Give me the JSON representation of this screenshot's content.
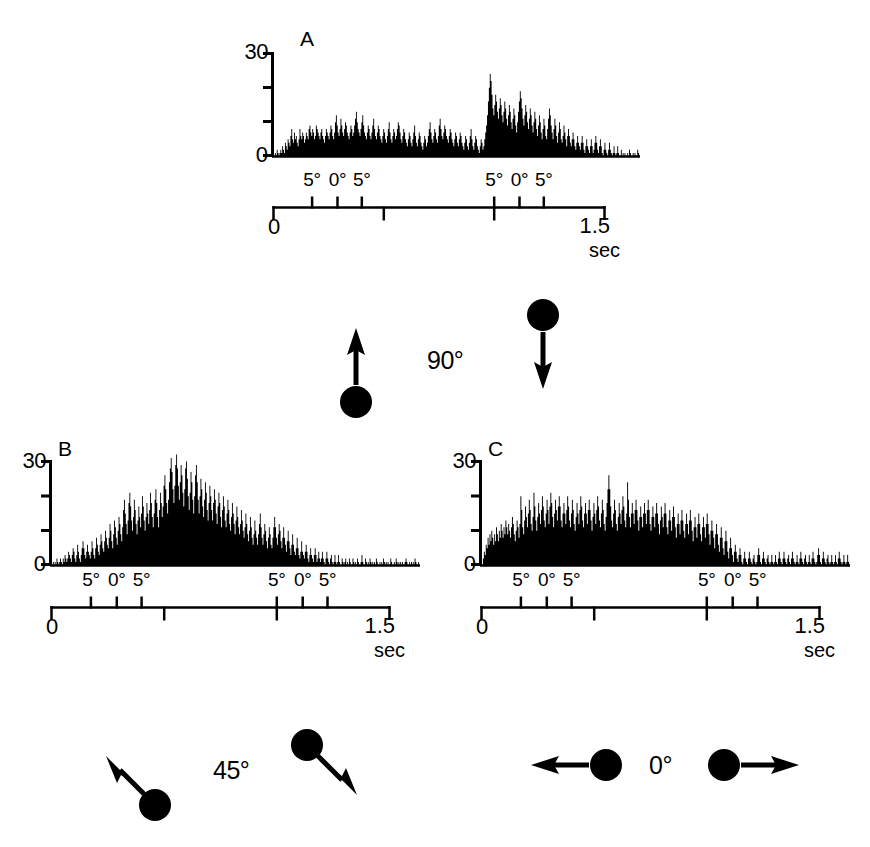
{
  "figure": {
    "type": "neurophysiology-psth-figure",
    "background": "#ffffff",
    "ink_color": "#000000"
  },
  "panels": [
    {
      "id": "A",
      "letter": "A",
      "y_axis": {
        "max_label": "30",
        "min_label": "0",
        "ticks": [
          0,
          10,
          20,
          30
        ],
        "max": 30,
        "min": 0
      },
      "x_axis": {
        "start_label": "0",
        "end_label": "1.5",
        "unit_label": "sec",
        "range": [
          0,
          1.5
        ],
        "major_division_times": [
          0.0,
          0.5,
          1.0,
          1.5
        ],
        "eye_position_ticks": [
          {
            "label": "5°",
            "t": 0.175
          },
          {
            "label": "0°",
            "t": 0.29
          },
          {
            "label": "5°",
            "t": 0.4
          },
          {
            "label": "5°",
            "t": 1.0
          },
          {
            "label": "0°",
            "t": 1.115
          },
          {
            "label": "5°",
            "t": 1.225
          }
        ]
      }
    },
    {
      "id": "B",
      "letter": "B",
      "y_axis": {
        "max_label": "30",
        "min_label": "0",
        "ticks": [
          0,
          10,
          20,
          30
        ],
        "max": 30,
        "min": 0
      },
      "x_axis": {
        "start_label": "0",
        "end_label": "1.5",
        "unit_label": "sec",
        "range": [
          0,
          1.5
        ],
        "major_division_times": [
          0.0,
          0.5,
          1.0,
          1.5
        ],
        "eye_position_ticks": [
          {
            "label": "5°",
            "t": 0.175
          },
          {
            "label": "0°",
            "t": 0.29
          },
          {
            "label": "5°",
            "t": 0.4
          },
          {
            "label": "5°",
            "t": 1.0
          },
          {
            "label": "0°",
            "t": 1.115
          },
          {
            "label": "5°",
            "t": 1.225
          }
        ]
      }
    },
    {
      "id": "C",
      "letter": "C",
      "y_axis": {
        "max_label": "30",
        "min_label": "0",
        "ticks": [
          0,
          10,
          20,
          30
        ],
        "max": 30,
        "min": 0
      },
      "x_axis": {
        "start_label": "0",
        "end_label": "1.5",
        "unit_label": "sec",
        "range": [
          0,
          1.5
        ],
        "major_division_times": [
          0.0,
          0.5,
          1.0,
          1.5
        ],
        "eye_position_ticks": [
          {
            "label": "5°",
            "t": 0.175
          },
          {
            "label": "0°",
            "t": 0.29
          },
          {
            "label": "5°",
            "t": 0.4
          },
          {
            "label": "5°",
            "t": 1.0
          },
          {
            "label": "0°",
            "t": 1.115
          },
          {
            "label": "5°",
            "t": 1.225
          }
        ]
      }
    }
  ],
  "stimulus_groups": [
    {
      "id": "stim-90",
      "angle_label": "90°",
      "icons": [
        {
          "name": "dot-arrow-up",
          "direction": "up"
        },
        {
          "name": "dot-arrow-down",
          "direction": "down"
        }
      ]
    },
    {
      "id": "stim-45",
      "angle_label": "45°",
      "icons": [
        {
          "name": "dot-arrow-up-left",
          "direction": "up-left"
        },
        {
          "name": "dot-arrow-down-right",
          "direction": "down-right"
        }
      ]
    },
    {
      "id": "stim-0",
      "angle_label": "0°",
      "icons": [
        {
          "name": "dot-arrow-left",
          "direction": "left"
        },
        {
          "name": "dot-arrow-right",
          "direction": "right"
        }
      ]
    }
  ],
  "chart_data": [
    {
      "type": "bar",
      "id": "A",
      "title": "A",
      "xlabel": "sec",
      "ylabel": "",
      "xlim": [
        0,
        1.5
      ],
      "ylim": [
        0,
        30
      ],
      "grid": false,
      "legend": false,
      "bin_width": 0.0075,
      "note": "Peristimulus time histogram, 90° direction pair; two activity epochs separated by a quiet gap",
      "values": [
        0,
        1,
        0,
        2,
        1,
        0,
        1,
        2,
        1,
        3,
        2,
        1,
        4,
        3,
        2,
        5,
        4,
        3,
        6,
        8,
        5,
        4,
        7,
        5,
        6,
        4,
        3,
        5,
        8,
        6,
        5,
        7,
        6,
        4,
        5,
        7,
        6,
        5,
        8,
        9,
        7,
        6,
        8,
        7,
        5,
        6,
        9,
        8,
        7,
        6,
        5,
        7,
        8,
        6,
        5,
        4,
        6,
        8,
        7,
        6,
        5,
        7,
        9,
        8,
        6,
        5,
        7,
        10,
        12,
        9,
        7,
        6,
        8,
        11,
        9,
        7,
        6,
        8,
        10,
        9,
        7,
        6,
        5,
        7,
        9,
        8,
        6,
        7,
        9,
        11,
        13,
        10,
        8,
        7,
        6,
        8,
        10,
        12,
        9,
        7,
        6,
        5,
        7,
        9,
        8,
        6,
        5,
        7,
        9,
        11,
        8,
        6,
        5,
        7,
        9,
        8,
        6,
        5,
        4,
        6,
        8,
        7,
        5,
        4,
        6,
        8,
        10,
        7,
        5,
        4,
        6,
        8,
        7,
        5,
        6,
        8,
        10,
        9,
        7,
        5,
        4,
        6,
        8,
        7,
        5,
        4,
        3,
        5,
        7,
        6,
        4,
        3,
        5,
        7,
        9,
        6,
        4,
        3,
        5,
        7,
        6,
        4,
        3,
        2,
        4,
        6,
        5,
        3,
        4,
        6,
        8,
        10,
        7,
        5,
        4,
        6,
        8,
        7,
        5,
        4,
        6,
        9,
        11,
        8,
        6,
        5,
        7,
        9,
        8,
        6,
        5,
        4,
        6,
        8,
        7,
        5,
        4,
        3,
        5,
        7,
        6,
        4,
        3,
        5,
        7,
        6,
        4,
        3,
        2,
        4,
        6,
        5,
        3,
        2,
        4,
        6,
        8,
        5,
        3,
        2,
        4,
        6,
        5,
        3,
        2,
        1,
        3,
        5,
        4,
        2,
        3,
        5,
        7,
        9,
        12,
        16,
        20,
        24,
        22,
        18,
        14,
        12,
        15,
        18,
        16,
        13,
        11,
        14,
        17,
        15,
        12,
        10,
        13,
        16,
        14,
        11,
        9,
        12,
        15,
        13,
        10,
        8,
        11,
        14,
        12,
        9,
        7,
        10,
        13,
        16,
        19,
        17,
        14,
        11,
        9,
        12,
        15,
        13,
        10,
        8,
        11,
        14,
        12,
        9,
        7,
        10,
        13,
        11,
        8,
        6,
        9,
        12,
        10,
        7,
        5,
        8,
        11,
        9,
        6,
        5,
        8,
        11,
        14,
        12,
        9,
        7,
        5,
        8,
        11,
        9,
        6,
        4,
        7,
        10,
        8,
        5,
        4,
        6,
        9,
        7,
        5,
        3,
        6,
        8,
        6,
        4,
        3,
        5,
        7,
        5,
        3,
        2,
        4,
        6,
        4,
        3,
        2,
        4,
        6,
        4,
        2,
        1,
        3,
        5,
        3,
        2,
        1,
        3,
        5,
        3,
        1,
        2,
        4,
        6,
        4,
        2,
        1,
        3,
        5,
        3,
        1,
        0,
        2,
        4,
        2,
        1,
        0,
        2,
        4,
        2,
        1,
        0,
        1,
        3,
        1,
        0,
        1,
        3,
        1,
        0,
        0,
        2,
        0,
        1,
        0,
        1,
        0,
        0,
        1,
        0,
        2,
        1,
        0,
        0,
        1,
        0,
        1,
        0,
        0,
        2,
        1,
        0
      ]
    },
    {
      "type": "bar",
      "id": "B",
      "title": "B",
      "xlabel": "sec",
      "ylabel": "",
      "xlim": [
        0,
        1.5
      ],
      "ylim": [
        0,
        32
      ],
      "grid": false,
      "legend": false,
      "bin_width": 0.0075,
      "note": "Peristimulus time histogram, 45° direction pair; single strong early peak reaching ~32 then decaying to baseline",
      "values": [
        0,
        1,
        0,
        1,
        0,
        2,
        1,
        0,
        1,
        2,
        1,
        0,
        2,
        1,
        3,
        2,
        1,
        2,
        4,
        3,
        2,
        1,
        3,
        5,
        4,
        2,
        1,
        3,
        6,
        4,
        2,
        1,
        3,
        5,
        7,
        5,
        3,
        2,
        4,
        6,
        4,
        3,
        2,
        4,
        7,
        5,
        3,
        2,
        5,
        8,
        6,
        4,
        3,
        6,
        9,
        7,
        5,
        4,
        7,
        10,
        8,
        6,
        5,
        8,
        12,
        10,
        7,
        5,
        9,
        13,
        11,
        8,
        6,
        10,
        14,
        12,
        9,
        7,
        11,
        16,
        19,
        15,
        12,
        9,
        13,
        18,
        21,
        17,
        13,
        10,
        14,
        19,
        16,
        12,
        9,
        13,
        17,
        14,
        11,
        15,
        20,
        17,
        13,
        10,
        14,
        18,
        15,
        12,
        16,
        21,
        18,
        14,
        11,
        15,
        19,
        22,
        18,
        14,
        11,
        16,
        21,
        18,
        14,
        17,
        23,
        26,
        22,
        18,
        15,
        19,
        24,
        28,
        31,
        27,
        22,
        18,
        23,
        29,
        32,
        28,
        23,
        19,
        24,
        29,
        26,
        21,
        17,
        22,
        28,
        30,
        25,
        20,
        16,
        21,
        27,
        24,
        19,
        15,
        20,
        26,
        29,
        24,
        19,
        15,
        20,
        25,
        22,
        17,
        14,
        19,
        24,
        21,
        16,
        13,
        18,
        23,
        20,
        16,
        13,
        18,
        22,
        19,
        15,
        12,
        17,
        21,
        18,
        14,
        11,
        16,
        20,
        17,
        13,
        11,
        15,
        19,
        16,
        12,
        10,
        14,
        18,
        15,
        12,
        9,
        13,
        17,
        14,
        11,
        9,
        12,
        16,
        13,
        10,
        8,
        11,
        15,
        12,
        9,
        7,
        10,
        14,
        11,
        8,
        6,
        9,
        13,
        10,
        8,
        6,
        9,
        12,
        15,
        11,
        8,
        6,
        9,
        12,
        10,
        7,
        5,
        8,
        11,
        9,
        6,
        5,
        8,
        11,
        14,
        11,
        8,
        6,
        9,
        12,
        10,
        7,
        5,
        8,
        11,
        8,
        6,
        4,
        7,
        10,
        7,
        5,
        3,
        6,
        9,
        6,
        4,
        3,
        5,
        8,
        5,
        3,
        2,
        4,
        7,
        4,
        3,
        2,
        4,
        6,
        4,
        2,
        1,
        3,
        5,
        3,
        2,
        1,
        3,
        5,
        3,
        1,
        2,
        4,
        2,
        1,
        2,
        4,
        2,
        1,
        0,
        2,
        4,
        2,
        1,
        0,
        2,
        3,
        1,
        0,
        1,
        3,
        1,
        0,
        1,
        3,
        1,
        0,
        0,
        2,
        1,
        0,
        1,
        2,
        0,
        1,
        0,
        2,
        1,
        0,
        0,
        2,
        1,
        0,
        1,
        0,
        2,
        1,
        0,
        0,
        1,
        3,
        1,
        0,
        0,
        2,
        1,
        0,
        1,
        0,
        2,
        1,
        0,
        1,
        0,
        1,
        0,
        2,
        1,
        0,
        0,
        1,
        0,
        1,
        0,
        2,
        1,
        0,
        1,
        0,
        1,
        0,
        0,
        2,
        1,
        0,
        0,
        1,
        0,
        2,
        1,
        0,
        1,
        0,
        1,
        0,
        1,
        0,
        0,
        1,
        2,
        1,
        0,
        0,
        1,
        0,
        1,
        0,
        1,
        0,
        2,
        1,
        0,
        0,
        1,
        0
      ]
    },
    {
      "type": "bar",
      "id": "C",
      "title": "C",
      "xlabel": "sec",
      "ylabel": "",
      "xlim": [
        0,
        1.5
      ],
      "ylim": [
        0,
        28
      ],
      "grid": false,
      "legend": false,
      "bin_width": 0.0075,
      "note": "Peristimulus time histogram, 0° direction pair; broad sustained plateau for first two-thirds then low baseline",
      "values": [
        0,
        2,
        4,
        3,
        6,
        5,
        8,
        6,
        9,
        7,
        10,
        8,
        6,
        9,
        7,
        11,
        9,
        7,
        10,
        8,
        12,
        10,
        8,
        11,
        9,
        13,
        11,
        9,
        12,
        10,
        8,
        11,
        14,
        12,
        9,
        7,
        10,
        13,
        11,
        8,
        12,
        20,
        16,
        11,
        9,
        13,
        17,
        14,
        11,
        15,
        19,
        16,
        12,
        10,
        14,
        21,
        17,
        13,
        10,
        14,
        18,
        15,
        12,
        16,
        20,
        17,
        13,
        11,
        15,
        19,
        16,
        12,
        17,
        21,
        18,
        14,
        11,
        15,
        19,
        16,
        13,
        17,
        20,
        17,
        13,
        11,
        15,
        18,
        15,
        12,
        16,
        20,
        17,
        13,
        11,
        15,
        19,
        16,
        12,
        10,
        14,
        18,
        15,
        12,
        16,
        20,
        17,
        13,
        11,
        15,
        18,
        15,
        12,
        16,
        19,
        16,
        13,
        10,
        14,
        18,
        15,
        12,
        16,
        20,
        17,
        13,
        11,
        15,
        19,
        16,
        12,
        10,
        14,
        18,
        22,
        26,
        22,
        17,
        13,
        11,
        15,
        19,
        16,
        12,
        10,
        14,
        18,
        15,
        12,
        16,
        20,
        17,
        13,
        11,
        15,
        24,
        19,
        14,
        11,
        15,
        18,
        15,
        12,
        16,
        19,
        16,
        13,
        10,
        14,
        17,
        14,
        11,
        15,
        18,
        15,
        12,
        16,
        19,
        16,
        12,
        10,
        14,
        17,
        14,
        11,
        15,
        18,
        15,
        12,
        9,
        13,
        17,
        14,
        11,
        15,
        18,
        15,
        11,
        9,
        13,
        16,
        13,
        10,
        14,
        17,
        14,
        11,
        8,
        12,
        15,
        12,
        9,
        13,
        16,
        13,
        10,
        8,
        12,
        15,
        12,
        9,
        13,
        16,
        13,
        10,
        7,
        11,
        14,
        11,
        8,
        12,
        15,
        12,
        9,
        7,
        11,
        14,
        11,
        8,
        12,
        15,
        12,
        9,
        6,
        10,
        13,
        10,
        8,
        5,
        9,
        12,
        9,
        6,
        4,
        8,
        11,
        8,
        5,
        3,
        7,
        10,
        7,
        4,
        2,
        5,
        8,
        5,
        3,
        1,
        4,
        6,
        4,
        2,
        1,
        3,
        5,
        3,
        1,
        0,
        2,
        4,
        2,
        1,
        0,
        2,
        4,
        2,
        1,
        0,
        2,
        3,
        1,
        0,
        1,
        3,
        5,
        3,
        1,
        0,
        2,
        4,
        2,
        1,
        0,
        2,
        3,
        1,
        0,
        1,
        3,
        1,
        0,
        1,
        3,
        1,
        0,
        2,
        4,
        2,
        1,
        0,
        2,
        4,
        2,
        1,
        0,
        2,
        3,
        1,
        0,
        2,
        4,
        2,
        1,
        0,
        1,
        3,
        1,
        0,
        2,
        4,
        2,
        1,
        0,
        2,
        3,
        1,
        0,
        1,
        3,
        1,
        0,
        2,
        4,
        2,
        1,
        0,
        1,
        3,
        5,
        3,
        1,
        0,
        2,
        4,
        2,
        1,
        0,
        2,
        3,
        1,
        0,
        1,
        3,
        1,
        0,
        1,
        3,
        1,
        0,
        2,
        4,
        2,
        1,
        0,
        1,
        3,
        1,
        0,
        1,
        3,
        1,
        0
      ]
    }
  ]
}
